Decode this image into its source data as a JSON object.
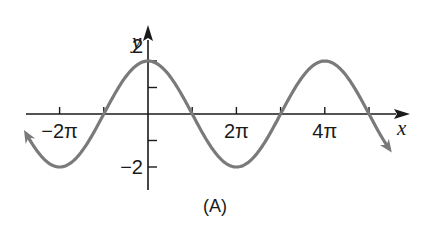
{
  "chart_data": {
    "type": "line",
    "title": "",
    "caption": "(A)",
    "xlabel": "x",
    "ylabel": "y",
    "function": "y = 2cos(x/2)",
    "xlim_pi": [
      -2.75,
      5.45
    ],
    "ylim": [
      -2,
      2
    ],
    "x_ticks_pi": [
      -2,
      -1,
      1,
      2,
      3,
      4,
      5
    ],
    "x_tick_labels": [
      {
        "value_pi": -2,
        "label": "−2π"
      },
      {
        "value_pi": 2,
        "label": "2π"
      },
      {
        "value_pi": 4,
        "label": "4π"
      }
    ],
    "y_ticks": [
      2,
      1,
      -1,
      -2
    ],
    "y_tick_labels": [
      {
        "value": 2,
        "label": "2"
      },
      {
        "value": -2,
        "label": "−2"
      }
    ],
    "series": [
      {
        "name": "y = 2cos(x/2)",
        "color": "#7a7a7a",
        "x_pi": [
          -2.75,
          -2,
          -1,
          0,
          1,
          2,
          3,
          4,
          5,
          5.45
        ],
        "y": [
          -1.85,
          -2,
          0,
          2,
          0,
          -2,
          0,
          2,
          0,
          -0.7
        ]
      }
    ],
    "end_arrows": true,
    "grid": false,
    "legend": null
  },
  "style": {
    "curve_color": "#7a7a7a",
    "axis_color": "#1a1a1a"
  }
}
